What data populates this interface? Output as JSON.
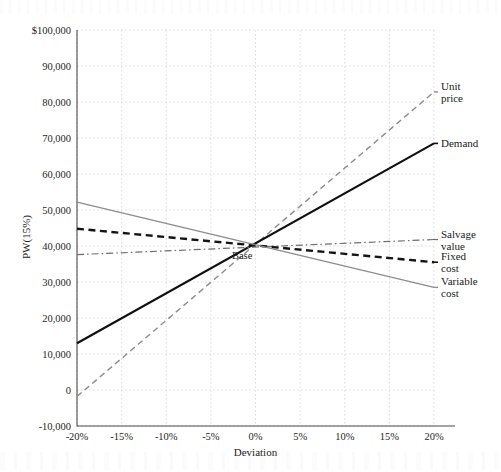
{
  "chart_data": {
    "type": "line",
    "title": "",
    "xlabel": "Deviation",
    "ylabel": "PW(15%)",
    "x": [
      -20,
      -15,
      -10,
      -5,
      0,
      5,
      10,
      15,
      20
    ],
    "xtick_labels": [
      "-20%",
      "-15%",
      "-10%",
      "-5%",
      "0%",
      "5%",
      "10%",
      "15%",
      "20%"
    ],
    "ytick_values": [
      -10000,
      0,
      10000,
      20000,
      30000,
      40000,
      50000,
      60000,
      70000,
      80000,
      90000,
      100000
    ],
    "ytick_labels": [
      "-10,000",
      "0",
      "10,000",
      "20,000",
      "30,000",
      "40,000",
      "50,000",
      "60,000",
      "70,000",
      "80,000",
      "90,000",
      "$100,000"
    ],
    "xlim": [
      -20,
      20
    ],
    "ylim": [
      -10000,
      100000
    ],
    "grid": true,
    "legend_position": "right-of-axes",
    "annotations": [
      {
        "text": "Base",
        "x": -1.5,
        "y": 36500
      }
    ],
    "series": [
      {
        "name": "Unit price",
        "label": "Unit\nprice",
        "label_lines": [
          "Unit",
          "price"
        ],
        "color": "#8c8c8c",
        "style": "dashed",
        "width": 1.4,
        "x": [
          -20,
          20
        ],
        "values": [
          -1800,
          82800
        ]
      },
      {
        "name": "Demand",
        "label": "Demand",
        "label_lines": [
          "Demand"
        ],
        "color": "#111111",
        "style": "solid",
        "width": 2.2,
        "x": [
          -20,
          20
        ],
        "values": [
          13000,
          68500
        ]
      },
      {
        "name": "Salvage value",
        "label": "Salvage\nvalue",
        "label_lines": [
          "Salvage",
          "value"
        ],
        "color": "#6e6e6e",
        "style": "dashdot",
        "width": 1.2,
        "x": [
          -20,
          20
        ],
        "values": [
          37600,
          41800
        ]
      },
      {
        "name": "Fixed cost",
        "label": "Fixed\ncost",
        "label_lines": [
          "Fixed",
          "cost"
        ],
        "color": "#141414",
        "style": "bold-dashed",
        "width": 2.4,
        "x": [
          -20,
          20
        ],
        "values": [
          44800,
          35500
        ]
      },
      {
        "name": "Variable cost",
        "label": "Variable\ncost",
        "label_lines": [
          "Variable",
          "cost"
        ],
        "color": "#8c8c8c",
        "style": "solid",
        "width": 1.3,
        "x": [
          -20,
          20
        ],
        "values": [
          52200,
          28500
        ]
      }
    ]
  },
  "layout": {
    "plot_left": 77,
    "plot_right": 434,
    "plot_top": 30,
    "plot_bottom": 426,
    "axis_bottom_extend": 455,
    "label_x": 441,
    "xlabel_y": 456,
    "ylabel_x": 30,
    "ylabel_y": 237
  },
  "colors": {
    "grid": "#cfcfcf",
    "axis": "#4a4a4a",
    "text": "#1a1a1a",
    "background": "#ffffff"
  }
}
